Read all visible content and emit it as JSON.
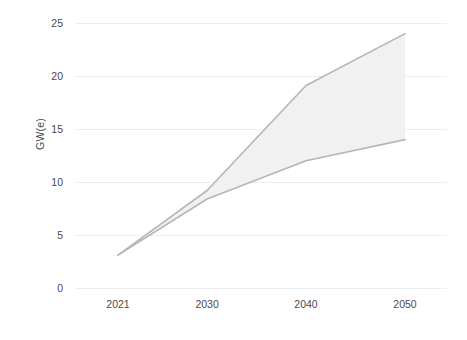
{
  "chart_data": {
    "type": "area",
    "title": "",
    "subtitle": "",
    "xlabel": "",
    "ylabel": "GW(e)",
    "categories": [
      "2021",
      "2030",
      "2040",
      "2050"
    ],
    "x_tick_labels": [
      "2021",
      "2030",
      "2040",
      "2050"
    ],
    "y_tick_labels": [
      "0",
      "5",
      "10",
      "15",
      "20",
      "25"
    ],
    "y_ticks": [
      0,
      5,
      10,
      15,
      20,
      25
    ],
    "ylim": [
      0,
      25
    ],
    "grid": "horizontal",
    "legend": "none",
    "series": [
      {
        "name": "Upper bound",
        "values": [
          3.1,
          9.2,
          19.1,
          24.0
        ]
      },
      {
        "name": "Lower bound",
        "values": [
          3.1,
          8.4,
          12.0,
          14.0
        ]
      }
    ],
    "band": {
      "fill_color": "#f1f1f1",
      "line_color": "#b6b6b6"
    },
    "colors": {
      "gridline": "#eceef0",
      "axis_text": "#4a4a4a",
      "background": "#ffffff"
    }
  }
}
